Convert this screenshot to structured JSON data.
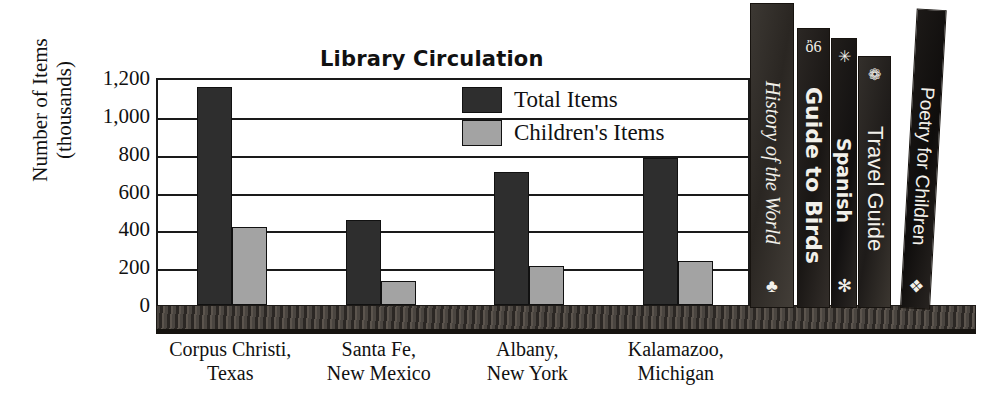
{
  "chart_data": {
    "type": "bar",
    "title": "Library Circulation",
    "xlabel": "",
    "ylabel": "Number of Items (thousands)",
    "ylim": [
      0,
      1200
    ],
    "yticks": [
      "0",
      "200",
      "400",
      "600",
      "800",
      "1,000",
      "1,200"
    ],
    "ytick_values": [
      0,
      200,
      400,
      600,
      800,
      1000,
      1200
    ],
    "grid": true,
    "legend_position": "upper center",
    "categories": [
      "Corpus Christi, Texas",
      "Santa Fe, New Mexico",
      "Albany, New York",
      "Kalamazoo, Michigan"
    ],
    "category_lines": [
      [
        "Corpus Christi,",
        "Texas"
      ],
      [
        "Santa Fe,",
        "New Mexico"
      ],
      [
        "Albany,",
        "New York"
      ],
      [
        "Kalamazoo,",
        "Michigan"
      ]
    ],
    "series": [
      {
        "name": "Total Items",
        "color": "#2e2e2e",
        "values": [
          1150,
          450,
          705,
          775
        ]
      },
      {
        "name": "Children's Items",
        "color": "#a3a3a3",
        "values": [
          410,
          125,
          205,
          230
        ]
      }
    ]
  },
  "axis": {
    "y_title_line1": "Number of Items",
    "y_title_line2": "(thousands)"
  },
  "legend": {
    "items": [
      {
        "label": "Total Items",
        "swatch": "#2e2e2e"
      },
      {
        "label": "Children's Items",
        "swatch": "#a3a3a3"
      }
    ]
  },
  "books": [
    {
      "title": "History of the World",
      "top_glyph": "",
      "bottom_glyph": "♣",
      "font_size": 20,
      "style": "italic"
    },
    {
      "title": "Guide to Birds",
      "top_glyph": "ὂ6",
      "bottom_glyph": "",
      "font_size": 22,
      "style": "bold"
    },
    {
      "title": "Spanish",
      "top_glyph": "✳",
      "bottom_glyph": "✻",
      "font_size": 19,
      "style": "bold"
    },
    {
      "title": "Travel Guide",
      "top_glyph": "❁",
      "bottom_glyph": "",
      "font_size": 22,
      "style": "normal"
    },
    {
      "title": "Poetry for Children",
      "top_glyph": "",
      "bottom_glyph": "❖",
      "font_size": 19,
      "style": "normal"
    }
  ],
  "colors": {
    "bar_total": "#2e2e2e",
    "bar_children": "#a3a3a3",
    "axis": "#1a1a1a",
    "shelf": "#3a3530",
    "text": "#111111"
  }
}
